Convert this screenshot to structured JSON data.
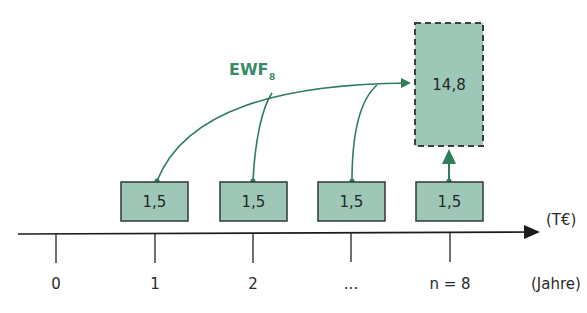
{
  "diagram": {
    "type": "cash-flow-timeline",
    "factor_label": "EWF",
    "factor_subscript": "8",
    "future_value": "14,8",
    "payments": [
      "1,5",
      "1,5",
      "1,5",
      "1,5"
    ],
    "time_ticks": [
      "0",
      "1",
      "2",
      "...",
      "n = 8"
    ],
    "value_unit": "(T€)",
    "time_unit": "(Jahre)",
    "colors": {
      "box_fill": "#9fc7b7",
      "box_border": "#2f3a36",
      "arrow_green": "#2e7d5b",
      "label_green": "#3a8a68",
      "axis": "#222222"
    }
  }
}
